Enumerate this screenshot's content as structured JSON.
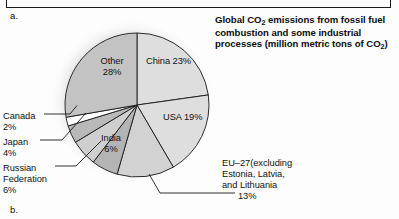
{
  "figure": {
    "letter_a": "a.",
    "letter_b": "b."
  },
  "title": {
    "line1_pre": "Global CO",
    "line1_sub": "2",
    "line1_post": " emissions from fossil fuel",
    "line2": "combustion and some industrial",
    "line3_pre": "processes (million metric tons of CO",
    "line3_sub": "2",
    "line3_post": ")",
    "full": "Global CO2 emissions from fossil fuel combustion and some industrial processes (million metric tons of CO2)"
  },
  "labels": {
    "other": "Other\n28%",
    "other_name": "Other",
    "other_pct": "28%",
    "china": "China 23%",
    "usa": "USA 19%",
    "india_name": "India",
    "india_pct": "6%",
    "canada": "Canada",
    "canada_pct": "2%",
    "japan": "Japan",
    "japan_pct": "4%",
    "russia_l1": "Russian",
    "russia_l2": "Federation",
    "russia_pct": "6%",
    "eu_l1": "EU–27(excluding",
    "eu_l2": "Estonia, Latvia,",
    "eu_l3": "and Lithuania",
    "eu_pct": "13%"
  },
  "colors": {
    "china": "#dedede",
    "usa": "#dedede",
    "eu27": "#d2d2d2",
    "india": "#b4b4b4",
    "russia": "#cfcfcf",
    "japan": "#b9b9b9",
    "canada": "#ffffff",
    "other": "#c3c3c3",
    "stroke": "#1a1a1a",
    "background": "#fdfdfd",
    "text": "#111111"
  },
  "chart_data": {
    "type": "pie",
    "title": "Global CO2 emissions from fossil fuel combustion and some industrial processes (million metric tons of CO2)",
    "unit": "percent",
    "legend": "none (direct labels)",
    "start_angle_deg": 0,
    "direction": "clockwise",
    "categories": [
      "China",
      "USA",
      "EU–27(excluding Estonia, Latvia, and Lithuania",
      "India",
      "Russian Federation",
      "Japan",
      "Canada",
      "Other"
    ],
    "values": [
      23,
      19,
      13,
      6,
      6,
      4,
      2,
      28
    ],
    "slices": [
      {
        "name": "China",
        "label": "China 23%",
        "value": 23,
        "color": "#dedede",
        "label_placement": "inside"
      },
      {
        "name": "USA",
        "label": "USA 19%",
        "value": 19,
        "color": "#dedede",
        "label_placement": "inside"
      },
      {
        "name": "EU–27",
        "label": "EU–27(excluding Estonia, Latvia, and Lithuania",
        "value": 13,
        "color": "#d2d2d2",
        "label_placement": "leader-line-right"
      },
      {
        "name": "India",
        "label": "India 6%",
        "value": 6,
        "color": "#b4b4b4",
        "label_placement": "inside"
      },
      {
        "name": "Russian Federation",
        "label": "Russian Federation 6%",
        "value": 6,
        "color": "#cfcfcf",
        "label_placement": "leader-line-left"
      },
      {
        "name": "Japan",
        "label": "Japan 4%",
        "value": 4,
        "color": "#b9b9b9",
        "label_placement": "leader-line-left"
      },
      {
        "name": "Canada",
        "label": "Canada 2%",
        "value": 2,
        "color": "#ffffff",
        "label_placement": "leader-line-left"
      },
      {
        "name": "Other",
        "label": "Other 28%",
        "value": 28,
        "color": "#c3c3c3",
        "label_placement": "inside"
      }
    ]
  }
}
